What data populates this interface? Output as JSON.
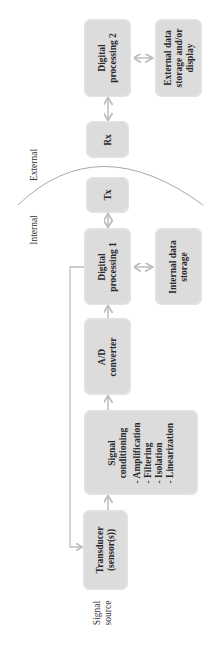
{
  "diagram": {
    "type": "block-diagram",
    "orientation": "rotated-90-ccw",
    "colors": {
      "box_fill": "#dcdcdc",
      "arrow": "#bdbdbd",
      "boundary_curve": "#a8a8a8",
      "text": "#2a2a2a"
    },
    "regions": {
      "internal_label": "Internal",
      "external_label": "External"
    },
    "signal_source": {
      "line1": "Signal",
      "line2": "source"
    },
    "blocks": {
      "transducer": {
        "line1": "Transducer",
        "line2": "(sensor(s))"
      },
      "signal_conditioning": {
        "line1": "Signal",
        "line2": "conditioning",
        "items": [
          "- Amplification",
          "- Filtering",
          "- Isolation",
          "- Linearization"
        ]
      },
      "ad_converter": {
        "line1": "A/D",
        "line2": "converter"
      },
      "digital_processing_1": {
        "line1": "Digital",
        "line2": "processing 1"
      },
      "internal_storage": {
        "line1": "Internal data",
        "line2": "storage"
      },
      "tx": {
        "line1": "Tx"
      },
      "rx": {
        "line1": "Rx"
      },
      "digital_processing_2": {
        "line1": "Digital",
        "line2": "processing 2"
      },
      "external_storage": {
        "line1": "External data",
        "line2": "storage and/or",
        "line3": "display"
      }
    },
    "connections": [
      {
        "from": "transducer",
        "to": "signal_conditioning",
        "type": "one-way"
      },
      {
        "from": "signal_conditioning",
        "to": "ad_converter",
        "type": "one-way"
      },
      {
        "from": "ad_converter",
        "to": "digital_processing_1",
        "type": "one-way"
      },
      {
        "from": "digital_processing_1",
        "to": "internal_storage",
        "type": "two-way"
      },
      {
        "from": "digital_processing_1",
        "to": "tx",
        "type": "two-way"
      },
      {
        "from": "rx",
        "to": "digital_processing_2",
        "type": "two-way"
      },
      {
        "from": "digital_processing_2",
        "to": "external_storage",
        "type": "two-way"
      },
      {
        "from": "digital_processing_1",
        "to": "transducer",
        "type": "feedback"
      }
    ]
  }
}
